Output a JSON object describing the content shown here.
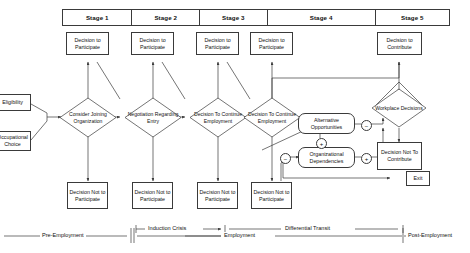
{
  "diagram": {
    "stage_header": {
      "stages": [
        {
          "label": "Stage 1"
        },
        {
          "label": "Stage 2"
        },
        {
          "label": "Stage 3"
        },
        {
          "label": "Stage 4"
        },
        {
          "label": "Stage 5"
        }
      ]
    },
    "inputs": [
      {
        "label": "Eligibility"
      },
      {
        "label": "Occupational Choice"
      }
    ],
    "top_decisions": [
      {
        "label": "Decision to Participate"
      },
      {
        "label": "Decision to Participate"
      },
      {
        "label": "Decision to Participate"
      },
      {
        "label": "Decision to Participate"
      },
      {
        "label": "Decision to Contribute"
      }
    ],
    "diamonds": [
      {
        "label": "Consider Joining Organization"
      },
      {
        "label": "Negotiation Regarding Entry"
      },
      {
        "label": "Decision To Continue Employment"
      },
      {
        "label": "Decision To Continue Employment"
      },
      {
        "label": "Workplace Decisions"
      }
    ],
    "bottom_decisions": [
      {
        "label": "Decision Not to Participate"
      },
      {
        "label": "Decision Not to Participate"
      },
      {
        "label": "Decision Not to Participate"
      },
      {
        "label": "Decision Not to Participate"
      }
    ],
    "feedback_nodes": [
      {
        "label": "Alternative Opportunities"
      },
      {
        "label": "Organizational Dependencies"
      }
    ],
    "outcome_nodes": [
      {
        "label": "Decision Not To Contribute"
      },
      {
        "label": "Exit"
      }
    ],
    "sign_markers": [
      {
        "name": "alt-opportunities-to-workplace",
        "sign": "−"
      },
      {
        "name": "org-dependencies-to-workplace",
        "sign": "+"
      },
      {
        "name": "alt-to-org-link",
        "sign": "+"
      },
      {
        "name": "org-dependencies-input",
        "sign": "−"
      }
    ],
    "phases": [
      {
        "label": "Pre-Employment"
      },
      {
        "label": "Induction Crisis"
      },
      {
        "label": "Employment"
      },
      {
        "label": "Differential Transit"
      },
      {
        "label": "Post-Employment"
      }
    ],
    "colors": {
      "stroke": "#3a3a3a",
      "text": "#111111",
      "background": "#ffffff"
    }
  }
}
